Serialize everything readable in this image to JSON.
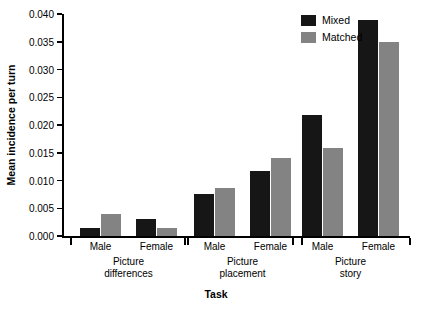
{
  "chart_data": {
    "type": "bar",
    "title": "",
    "xlabel": "Task",
    "ylabel": "Mean incidence per turn",
    "ylim": [
      0.0,
      0.04
    ],
    "yticks": [
      "0.000",
      "0.005",
      "0.010",
      "0.015",
      "0.020",
      "0.025",
      "0.030",
      "0.035",
      "0.040"
    ],
    "ytick_values": [
      0.0,
      0.005,
      0.01,
      0.015,
      0.02,
      0.025,
      0.03,
      0.035,
      0.04
    ],
    "grid": false,
    "legend_position": "top-right",
    "groups": [
      {
        "name": "Picture differences",
        "line1": "Picture",
        "line2": "differences"
      },
      {
        "name": "Picture placement",
        "line1": "Picture",
        "line2": "placement"
      },
      {
        "name": "Picture story",
        "line1": "Picture",
        "line2": "story"
      }
    ],
    "categories": [
      "Male",
      "Female",
      "Male",
      "Female",
      "Male",
      "Female"
    ],
    "series": [
      {
        "name": "Mixed",
        "color": "#161616",
        "values": [
          0.0015,
          0.003,
          0.0075,
          0.0118,
          0.0218,
          0.039
        ]
      },
      {
        "name": "Matched",
        "color": "#838383",
        "values": [
          0.004,
          0.0015,
          0.0086,
          0.014,
          0.0158,
          0.035
        ]
      }
    ]
  },
  "legend": {
    "items": [
      {
        "label": "Mixed"
      },
      {
        "label": "Matched"
      }
    ]
  }
}
